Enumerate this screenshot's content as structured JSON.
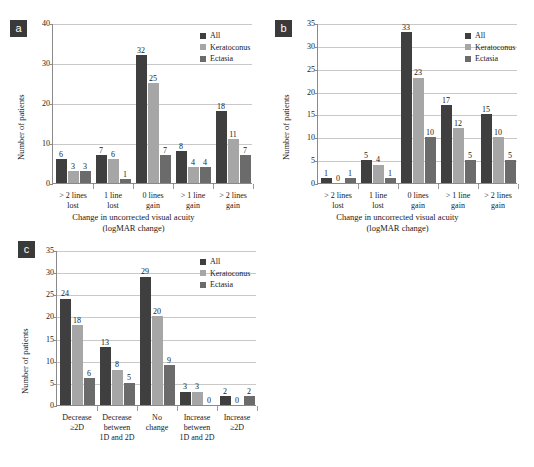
{
  "figure": {
    "colors": {
      "all": "#3f3f3f",
      "keratoconus": "#a6a6a6",
      "ectasia": "#6b6b6b",
      "axis": "#8a8a8a",
      "grid": "#c9c9c9",
      "tag_bg": "#3a3a3a",
      "tag_fg": "#ffffff"
    },
    "legend": {
      "items": [
        {
          "label": "All",
          "color": "#3f3f3f"
        },
        {
          "label": "Keratoconus",
          "color": "#a6a6a6"
        },
        {
          "label": "Ectasia",
          "color": "#6b6b6b"
        }
      ]
    }
  },
  "chart_data": [
    {
      "id": "a",
      "panel_label": "a",
      "type": "bar",
      "title": "",
      "xlabel": "Change in uncorrected visual acuity\n(logMAR change)",
      "ylabel": "Number of patients",
      "ylim": [
        0,
        40
      ],
      "yticks": [
        0,
        10,
        20,
        30,
        40
      ],
      "grid": true,
      "legend_position": "top-right",
      "categories": [
        "> 2 lines\nlost",
        "1 line\nlost",
        "0 lines\ngain",
        "> 1 line\ngain",
        "> 2 lines\ngain"
      ],
      "series": [
        {
          "name": "All",
          "values": [
            6,
            7,
            32,
            8,
            18
          ]
        },
        {
          "name": "Keratoconus",
          "values": [
            3,
            6,
            25,
            4,
            11
          ]
        },
        {
          "name": "Ectasia",
          "values": [
            3,
            1,
            7,
            4,
            7
          ]
        }
      ]
    },
    {
      "id": "b",
      "panel_label": "b",
      "type": "bar",
      "title": "",
      "xlabel": "Change in uncorrected visual acuity\n(logMAR change)",
      "ylabel": "Number of patients",
      "ylim": [
        0,
        35
      ],
      "yticks": [
        0,
        5,
        10,
        15,
        20,
        25,
        30,
        35
      ],
      "grid": true,
      "legend_position": "top-right",
      "categories": [
        "> 2 lines\nlost",
        "1 line\nlost",
        "0 lines\ngain",
        "> 1 line\ngain",
        "> 2 lines\ngain"
      ],
      "series": [
        {
          "name": "All",
          "values": [
            1,
            5,
            33,
            17,
            15
          ]
        },
        {
          "name": "Keratoconus",
          "values": [
            0,
            4,
            23,
            12,
            10
          ]
        },
        {
          "name": "Ectasia",
          "values": [
            1,
            1,
            10,
            5,
            5
          ]
        }
      ]
    },
    {
      "id": "c",
      "panel_label": "c",
      "type": "bar",
      "title": "",
      "xlabel": "",
      "ylabel": "Number of patients",
      "ylim": [
        0,
        35
      ],
      "yticks": [
        0,
        5,
        10,
        15,
        20,
        25,
        30,
        35
      ],
      "grid": true,
      "legend_position": "top-right",
      "categories": [
        "Decrease\n≥2D",
        "Decrease\nbetween\n1D and 2D",
        "No\nchange",
        "Increase\nbetween\n1D and 2D",
        "Increase\n≥2D"
      ],
      "series": [
        {
          "name": "All",
          "values": [
            24,
            13,
            29,
            3,
            2
          ]
        },
        {
          "name": "Keratoconus",
          "values": [
            18,
            8,
            20,
            3,
            0
          ]
        },
        {
          "name": "Ectasia",
          "values": [
            6,
            5,
            9,
            0,
            2
          ]
        }
      ]
    }
  ]
}
